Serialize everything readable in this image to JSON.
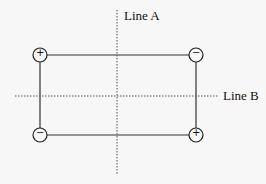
{
  "diagram": {
    "lines": {
      "a": {
        "label": "Line A"
      },
      "b": {
        "label": "Line B"
      }
    },
    "charges": [
      {
        "position": "top-left",
        "sign": "+"
      },
      {
        "position": "top-right",
        "sign": "−"
      },
      {
        "position": "bottom-left",
        "sign": "−"
      },
      {
        "position": "bottom-right",
        "sign": "+"
      }
    ],
    "colors": {
      "stroke": "#222222",
      "background": "#f7f7f7"
    }
  }
}
